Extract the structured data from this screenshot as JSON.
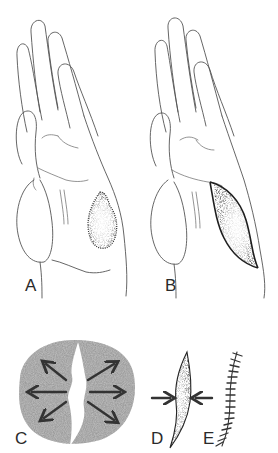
{
  "figure": {
    "panels": [
      {
        "id": "A",
        "label": "A",
        "description": "Palm of hand with irregular stippled lesion on hypothenar side"
      },
      {
        "id": "B",
        "label": "B",
        "description": "Palm of hand with elliptical (fusiform) excision outline around lesion"
      },
      {
        "id": "C",
        "label": "C",
        "description": "Circular shaded skin area with central wound; arrows indicate outward tension"
      },
      {
        "id": "D",
        "label": "D",
        "description": "Fusiform ellipse with inward-pointing arrows indicating closure"
      },
      {
        "id": "E",
        "label": "E",
        "description": "Curved sutured closure line with cross ticks"
      }
    ],
    "colors": {
      "line": "#555555",
      "stipple_dark": "#2b2b2b",
      "stipple_mid": "#8a8a8a",
      "shade": "#8c8c8c",
      "arrow": "#333333",
      "background": "#ffffff"
    },
    "suture_count": 17
  }
}
